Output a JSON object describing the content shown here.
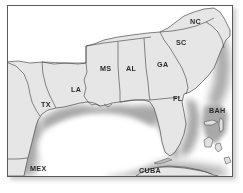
{
  "map": {
    "title": "Southeastern United States and Gulf of Mexico reference map",
    "projection_note": "unlabeled reference map",
    "colors": {
      "land": "#e6e6e6",
      "water": "#ffffff",
      "coastal_halo": "#a8a8a8",
      "boundary_line": "#4a4a4a",
      "frame": "#5a5a5a",
      "label_text": "#2b2b2b",
      "page_background": "#ffffff"
    },
    "labels": [
      {
        "id": "tx",
        "text": "TX",
        "x": 33,
        "y": 106
      },
      {
        "id": "la",
        "text": "LA",
        "x": 70,
        "y": 91
      },
      {
        "id": "ms",
        "text": "MS",
        "x": 99,
        "y": 70
      },
      {
        "id": "al",
        "text": "AL",
        "x": 124,
        "y": 70
      },
      {
        "id": "ga",
        "text": "GA",
        "x": 156,
        "y": 66
      },
      {
        "id": "sc",
        "text": "SC",
        "x": 175,
        "y": 44
      },
      {
        "id": "nc",
        "text": "NC",
        "x": 189,
        "y": 23
      },
      {
        "id": "fl",
        "text": "FL",
        "x": 171,
        "y": 100
      },
      {
        "id": "mex",
        "text": "MEX",
        "x": 29,
        "y": 170
      },
      {
        "id": "cuba",
        "text": "CUBA",
        "x": 140,
        "y": 172
      },
      {
        "id": "bah",
        "text": "BAH",
        "x": 209,
        "y": 112
      }
    ],
    "regions": [
      "Texas",
      "Louisiana",
      "Mississippi",
      "Alabama",
      "Georgia",
      "South Carolina",
      "North Carolina",
      "Florida",
      "Tennessee",
      "Arkansas",
      "Mexico",
      "Cuba",
      "Bahamas"
    ],
    "water_bodies": [
      "Gulf of Mexico",
      "Atlantic Ocean",
      "Straits of Florida"
    ]
  }
}
